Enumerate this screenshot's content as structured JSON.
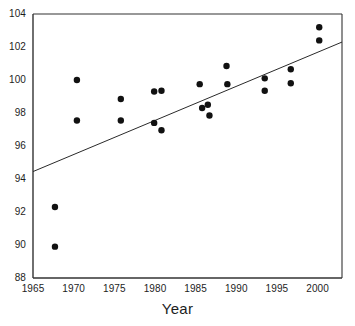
{
  "chart_data": {
    "type": "scatter",
    "title": "",
    "xlabel": "Year",
    "ylabel": "",
    "xlim": [
      1965,
      2003
    ],
    "ylim": [
      88,
      104
    ],
    "grid": false,
    "legend": null,
    "xticks": [
      1965,
      1970,
      1975,
      1980,
      1985,
      1990,
      1995,
      2000
    ],
    "xtick_labels": [
      "1965",
      "1970",
      "1975",
      "1980",
      "1985",
      "1990",
      "1995",
      "2000"
    ],
    "yticks": [
      88,
      90,
      92,
      94,
      96,
      98,
      100,
      102,
      104
    ],
    "ytick_labels": [
      "88",
      "90",
      "92",
      "94",
      "96",
      "98",
      "100",
      "102",
      "104"
    ],
    "marker": {
      "shape": "circle",
      "color": "#111111",
      "size": 6.4
    },
    "series": [
      {
        "name": "observations",
        "points": [
          {
            "x": 1967.7,
            "y": 92.3
          },
          {
            "x": 1967.7,
            "y": 89.9
          },
          {
            "x": 1970.4,
            "y": 100.0
          },
          {
            "x": 1970.4,
            "y": 97.55
          },
          {
            "x": 1975.8,
            "y": 98.85
          },
          {
            "x": 1975.8,
            "y": 97.55
          },
          {
            "x": 1979.9,
            "y": 99.3
          },
          {
            "x": 1979.9,
            "y": 97.4
          },
          {
            "x": 1980.8,
            "y": 99.35
          },
          {
            "x": 1980.8,
            "y": 96.95
          },
          {
            "x": 1985.5,
            "y": 99.75
          },
          {
            "x": 1985.8,
            "y": 98.3
          },
          {
            "x": 1986.5,
            "y": 98.5
          },
          {
            "x": 1986.7,
            "y": 97.85
          },
          {
            "x": 1988.8,
            "y": 100.85
          },
          {
            "x": 1988.9,
            "y": 99.75
          },
          {
            "x": 1993.5,
            "y": 100.1
          },
          {
            "x": 1993.5,
            "y": 99.35
          },
          {
            "x": 1996.7,
            "y": 100.65
          },
          {
            "x": 1996.7,
            "y": 99.8
          },
          {
            "x": 2000.2,
            "y": 103.2
          },
          {
            "x": 2000.2,
            "y": 102.4
          }
        ]
      }
    ],
    "trendline": {
      "name": "linear-fit",
      "color": "#2a2a2a",
      "x_start": 1965,
      "y_start": 94.45,
      "x_end": 2003,
      "y_end": 102.3
    },
    "axis_color": "#333333"
  }
}
